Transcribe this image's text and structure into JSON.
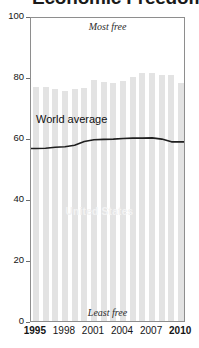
{
  "title": {
    "text": "Economic Freedom Index",
    "clipped": true
  },
  "annotations": {
    "top": "Most free",
    "bottom": "Least free",
    "world_series_label": "World average",
    "bars_series_label": "United States"
  },
  "colors": {
    "bar": "#e3e3e3",
    "line": "#1f1f1f",
    "frame": "#8e8e8e",
    "text": "#141414",
    "bar_label": "#f2f2f2"
  },
  "chart_data": {
    "type": "bar",
    "title": "Economic Freedom Index",
    "xlabel": "",
    "ylabel": "",
    "ylim": [
      0,
      100
    ],
    "yticks": [
      0,
      20,
      40,
      60,
      80,
      100
    ],
    "ytick_labels": [
      "0",
      "20",
      "40",
      "60",
      "80",
      "100"
    ],
    "grid": false,
    "legend": "in-plot labels",
    "categories": [
      "1995",
      "1996",
      "1997",
      "1998",
      "1999",
      "2000",
      "2001",
      "2002",
      "2003",
      "2004",
      "2005",
      "2006",
      "2007",
      "2008",
      "2009",
      "2010"
    ],
    "xtick_labels": [
      "1995",
      "1998",
      "2001",
      "2004",
      "2007",
      "2010"
    ],
    "xtick_bold": [
      "1995",
      "2010"
    ],
    "series": [
      {
        "name": "United States",
        "type": "bar",
        "values": [
          76.7,
          76.7,
          76.2,
          75.4,
          76.0,
          76.4,
          79.1,
          78.4,
          78.2,
          78.7,
          79.9,
          81.2,
          81.2,
          80.6,
          80.7,
          78.0
        ]
      },
      {
        "name": "World average",
        "type": "line",
        "values": [
          57.2,
          57.3,
          57.6,
          57.8,
          58.3,
          59.5,
          60.1,
          60.2,
          60.3,
          60.5,
          60.6,
          60.6,
          60.7,
          60.3,
          59.4,
          59.4
        ]
      }
    ]
  }
}
